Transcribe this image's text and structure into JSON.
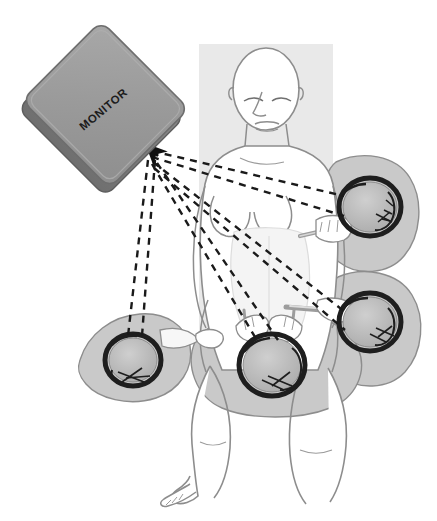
{
  "figure": {
    "type": "medical-illustration",
    "canvas": {
      "width": 437,
      "height": 521,
      "background": "#ffffff"
    }
  },
  "monitor": {
    "label": "MONITOR",
    "label_rotation_deg": -40,
    "shape": "rounded-rectangle",
    "rotation_deg": 45,
    "center": {
      "x": 104,
      "y": 106
    },
    "face_color": "#9a9a9a",
    "edge_color": "#7d7d7d",
    "outline_color": "#5e5e5e"
  },
  "operating_table": {
    "name": "operating-table",
    "color": "#e9e9e9",
    "rect": {
      "x": 199,
      "y": 44,
      "width": 134,
      "height": 336
    }
  },
  "patient": {
    "name": "patient",
    "position": "supine-lithotomy",
    "skin_fill": "#ffffff",
    "outline_color": "#8d8d8d",
    "drape_color": "#f4f4f4"
  },
  "sightlines": {
    "name": "monitor-sightlines",
    "style": "dashed",
    "color": "#1a1a1a",
    "dash": "7 6",
    "width": 2.4,
    "converge_point": {
      "x": 150,
      "y": 147
    },
    "arrowhead": true,
    "count": 8
  },
  "staff": [
    {
      "id": "surgeon-upper-right",
      "label": "Surgeon (head, top view)",
      "center": {
        "x": 370,
        "y": 207
      },
      "radius": 30,
      "cap_color": "#b7b7b7",
      "hair_color": "#1e1e1e",
      "body_color": "#c9c9c9"
    },
    {
      "id": "assistant-lower-right",
      "label": "Assistant (head, top view)",
      "center": {
        "x": 370,
        "y": 322
      },
      "radius": 30,
      "cap_color": "#b7b7b7",
      "hair_color": "#1e1e1e",
      "body_color": "#c9c9c9"
    },
    {
      "id": "surgeon-perineal",
      "label": "Perineal surgeon (head, top view)",
      "center": {
        "x": 272,
        "y": 365
      },
      "radius": 32,
      "cap_color": "#b7b7b7",
      "hair_color": "#1e1e1e",
      "body_color": "#c9c9c9"
    },
    {
      "id": "assistant-left",
      "label": "Assistant (head, top view)",
      "center": {
        "x": 133,
        "y": 360
      },
      "radius": 27,
      "cap_color": "#b7b7b7",
      "hair_color": "#1e1e1e",
      "body_color": "#c9c9c9"
    }
  ],
  "instruments": {
    "name": "laparoscopic-instruments",
    "color": "#9d9d9d",
    "count": 3
  }
}
